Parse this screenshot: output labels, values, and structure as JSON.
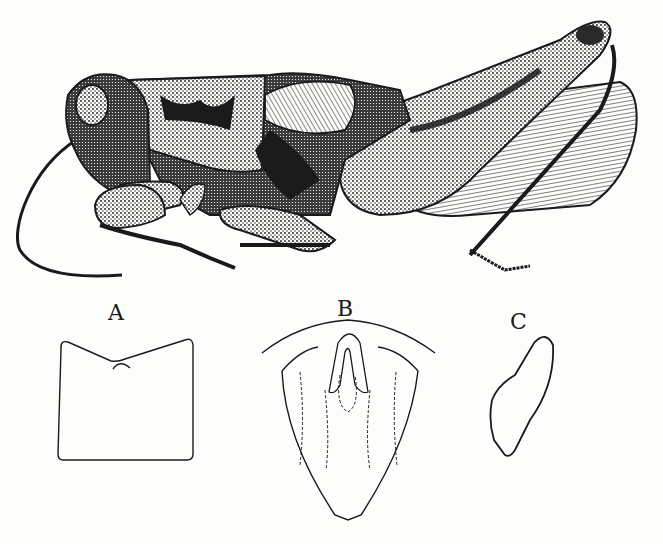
{
  "figure": {
    "main_subject": "grasshopper-lateral-view",
    "labels": {
      "a": "A",
      "b": "B",
      "c": "C"
    }
  },
  "colors": {
    "ink": "#1a1a1a",
    "paper": "#fdfdfb"
  }
}
